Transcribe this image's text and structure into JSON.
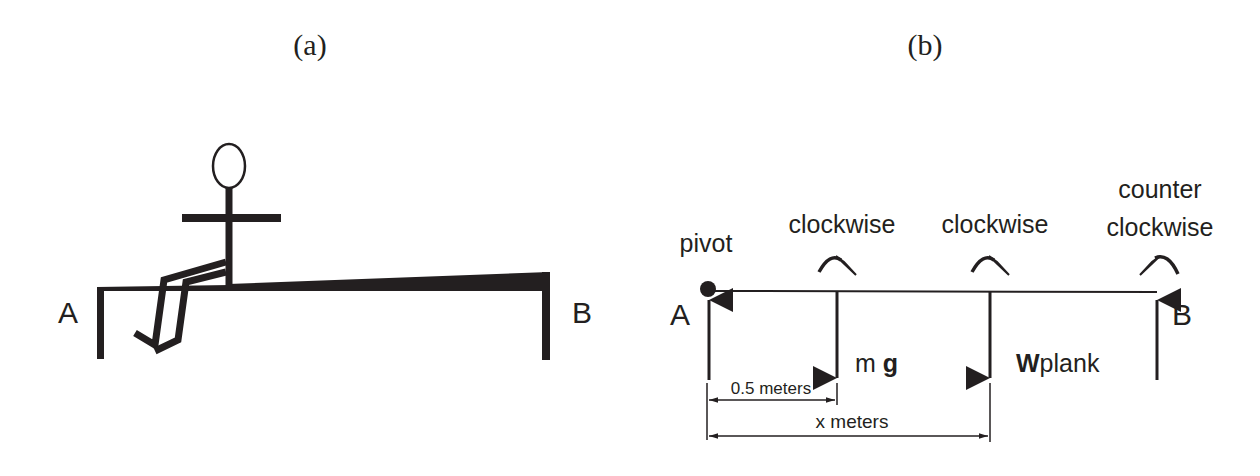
{
  "panel_a": {
    "caption": "(a)",
    "label_left": "A",
    "label_right": "B"
  },
  "panel_b": {
    "caption": "(b)",
    "label_left": "A",
    "label_right": "B",
    "pivot_label": "pivot",
    "torque_labels": {
      "mg": "clockwise",
      "wplank": "clockwise",
      "b_line1": "counter",
      "b_line2": "clockwise"
    },
    "force_labels": {
      "mg_m": "m ",
      "mg_g": "g",
      "wplank_w": "W",
      "wplank_rest": "plank"
    },
    "dimensions": {
      "short": "0.5 meters",
      "long": "x meters"
    }
  },
  "colors": {
    "ink": "#231f20",
    "background": "#ffffff"
  }
}
